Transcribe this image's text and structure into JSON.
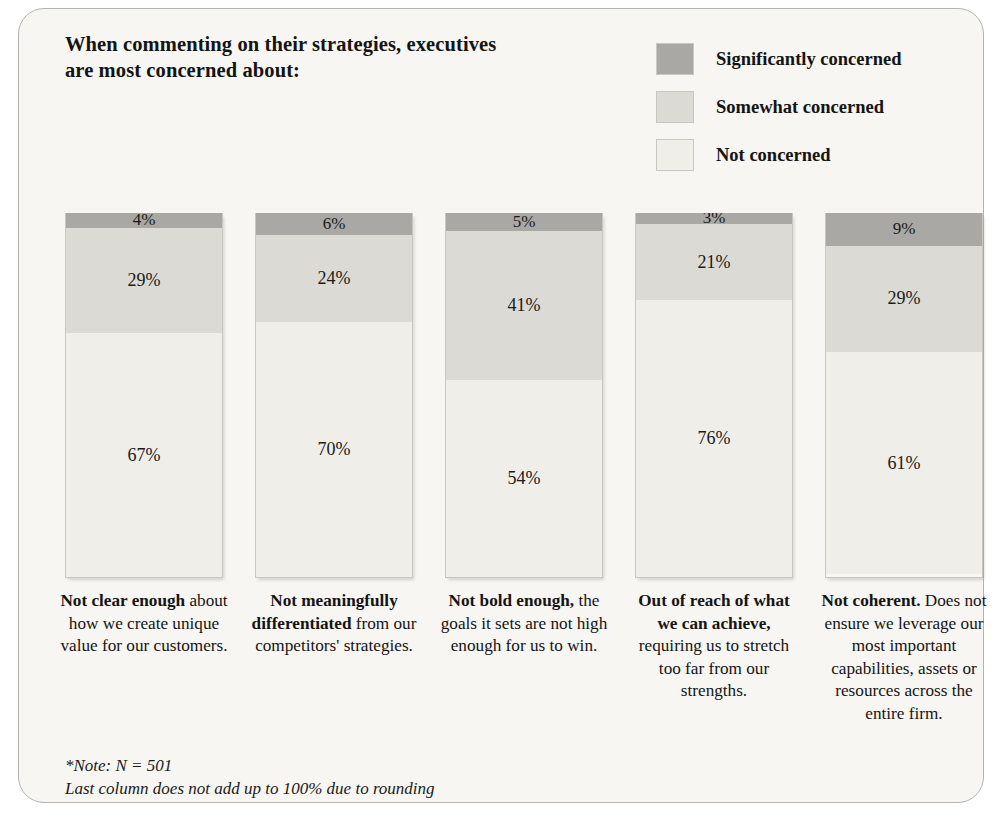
{
  "title": {
    "line1": "When commenting on their strategies, executives",
    "line2": "are most concerned about:"
  },
  "legend": {
    "items": [
      {
        "label": "Significantly concerned",
        "color": "#a9a8a4"
      },
      {
        "label": "Somewhat concerned",
        "color": "#dcdad5"
      },
      {
        "label": "Not concerned",
        "color": "#f0eee9"
      }
    ]
  },
  "footnote": {
    "line1": "*Note: N = 501",
    "line2": "Last column does not add up to 100% due to rounding"
  },
  "chart_data": {
    "type": "bar",
    "subtype": "stacked-column-100",
    "title": "When commenting on their strategies, executives are most concerned about:",
    "xlabel": "",
    "ylabel": "",
    "ylim": [
      0,
      100
    ],
    "grid": false,
    "legend_position": "top-right",
    "categories": [
      "Not clear enough about how we create unique value for our customers.",
      "Not meaningfully differentiated from our competitors' strategies.",
      "Not bold enough, the goals it sets are not high enough for us to win.",
      "Out of reach of what we can achieve, requiring us to stretch too far from our strengths.",
      "Not coherent. Does not ensure we leverage our most important capabilities, assets or resources across the entire firm."
    ],
    "series": [
      {
        "name": "Significantly concerned",
        "color": "#a9a8a4",
        "values": [
          4,
          6,
          5,
          3,
          9
        ]
      },
      {
        "name": "Somewhat concerned",
        "color": "#dcdad5",
        "values": [
          29,
          24,
          41,
          21,
          29
        ]
      },
      {
        "name": "Not concerned",
        "color": "#f0eee9",
        "values": [
          67,
          70,
          54,
          76,
          61
        ]
      }
    ],
    "value_labels": [
      [
        "4%",
        "29%",
        "67%"
      ],
      [
        "6%",
        "24%",
        "70%"
      ],
      [
        "5%",
        "41%",
        "54%"
      ],
      [
        "3%",
        "21%",
        "76%"
      ],
      [
        "9%",
        "29%",
        "61%"
      ]
    ]
  },
  "columns": [
    {
      "label_bold": "Not clear enough",
      "label_rest": "about how we create unique value for our customers.",
      "significantly": "4%",
      "somewhat": "29%",
      "not": "67%"
    },
    {
      "label_bold": "Not meaningfully differentiated",
      "label_rest": "from our competitors' strategies.",
      "significantly": "6%",
      "somewhat": "24%",
      "not": "70%"
    },
    {
      "label_bold": "Not bold enough,",
      "label_rest": "the goals it sets are not high enough for us to win.",
      "significantly": "5%",
      "somewhat": "41%",
      "not": "54%"
    },
    {
      "label_bold": "Out of reach of what we can achieve,",
      "label_rest": "requiring us to stretch too far from our strengths.",
      "significantly": "3%",
      "somewhat": "21%",
      "not": "76%"
    },
    {
      "label_bold": "Not coherent.",
      "label_rest": "Does not ensure we leverage our most important capabilities, assets or resources across the entire firm.",
      "significantly": "9%",
      "somewhat": "29%",
      "not": "61%"
    }
  ]
}
